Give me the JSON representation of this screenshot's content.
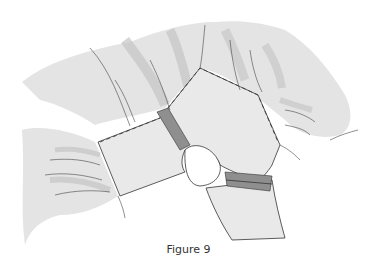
{
  "figure": {
    "caption": "Figure 9",
    "colors": {
      "fabric": "#e6e6e6",
      "fabric_shade": "#c8c8c8",
      "band": "#8f8f8f",
      "outline": "#333333"
    }
  }
}
